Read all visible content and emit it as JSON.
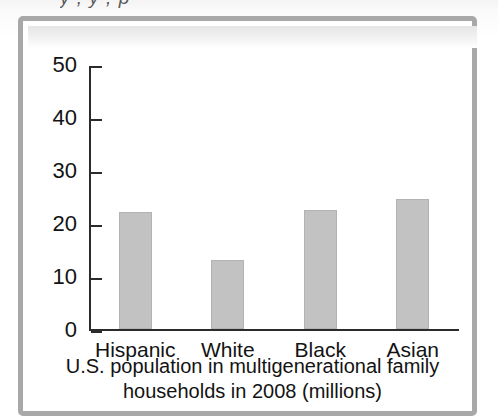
{
  "figure": {
    "cropped_heading_above": "y  ,  y  ,  p",
    "frame_color": "#a8a8a8",
    "bar_color": "#c2c2c2",
    "axis_color": "#2b2b2b"
  },
  "chart_data": {
    "type": "bar",
    "title": "",
    "caption_line_1": "U.S. population in multigenerational family",
    "caption_line_2": "households in 2008 (millions)",
    "categories": [
      "Hispanic",
      "White",
      "Black",
      "Asian"
    ],
    "values": [
      22,
      13,
      22.5,
      24.5
    ],
    "xlabel": "",
    "ylabel": "",
    "ylim": [
      0,
      50
    ],
    "yticks": [
      0,
      10,
      20,
      30,
      40,
      50
    ],
    "ytick_labels": [
      "0",
      "10",
      "20",
      "30",
      "40",
      "50"
    ],
    "grid": false,
    "legend": false
  }
}
